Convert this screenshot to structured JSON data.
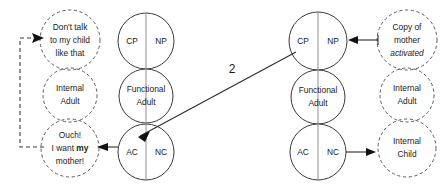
{
  "diagram": {
    "colors": {
      "solid_stroke": "#3a3a3a",
      "dashed_stroke": "#5a5a5a",
      "arrow": "#2b2b2b",
      "divider": "#8f8f8f",
      "text": "#1a1a1a",
      "background": "#ffffff"
    },
    "transaction_number": "2",
    "left_person": {
      "solid_stack": {
        "parent": {
          "left_label": "CP",
          "right_label": "NP"
        },
        "adult": {
          "line1": "Functional",
          "line2": "Adult"
        },
        "child": {
          "left_label": "AC",
          "right_label": "NC"
        }
      },
      "dashed_stack": {
        "parent": {
          "line1": "Don't talk",
          "line2": "to my child",
          "line3": "like that"
        },
        "adult": {
          "line1": "Internal",
          "line2": "Adult"
        },
        "child": {
          "line1": "Ouch!",
          "line2_pre": "I want ",
          "line2_bold": "my",
          "line3": "mother!"
        }
      }
    },
    "right_person": {
      "solid_stack": {
        "parent": {
          "left_label": "CP",
          "right_label": "NP"
        },
        "adult": {
          "line1": "Functional",
          "line2": "Adult"
        },
        "child": {
          "left_label": "AC",
          "right_label": "NC"
        }
      },
      "dashed_stack": {
        "parent": {
          "line1": "Copy of",
          "line2": "mother",
          "line3_italic": "activated"
        },
        "adult": {
          "line1": "Internal",
          "line2": "Adult"
        },
        "child": {
          "line1": "Internal",
          "line2": "Child"
        }
      }
    }
  }
}
